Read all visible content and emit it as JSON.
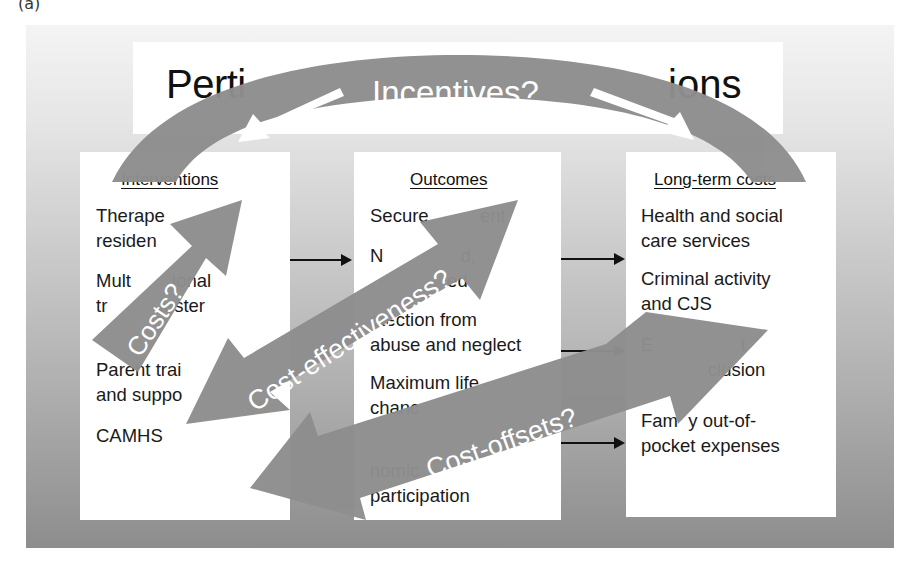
{
  "panel_label": "(a)",
  "title": {
    "left_part": "Perti",
    "right_part": "ions",
    "full_text_partially_hidden": "Pertinent questions"
  },
  "boxes": [
    {
      "heading": "Interventions",
      "items": [
        {
          "line1": "Therape",
          "line2": "residen"
        },
        {
          "line1": "Mult        ional",
          "line2": "tr          foster"
        },
        {
          "line1": "Parent trai",
          "line2": "and suppo"
        },
        {
          "line1": "CAMHS",
          "line2": ""
        }
      ]
    },
    {
      "heading": "Outcomes",
      "items": [
        {
          "line1": "Secure          ent",
          "line2": ""
        },
        {
          "line1": "N               d,",
          "line2": "               ed"
        },
        {
          "line1": "otection from",
          "line2": "abuse and neglect"
        },
        {
          "line1": "Maximum life",
          "line2": "chanc"
        },
        {
          "line1": "nomic",
          "line2": "participation"
        }
      ]
    },
    {
      "heading": "Long-term costs",
      "items": [
        {
          "line1": "Health and social",
          "line2": "care services"
        },
        {
          "line1": "Criminal activity",
          "line2": "and CJS"
        },
        {
          "line1": "E                 t",
          "line2": "             clusion"
        },
        {
          "line1": "Fam  y out-of-",
          "line2": "pocket expenses"
        }
      ]
    }
  ],
  "overlay_arrows": [
    {
      "label": "Incentives?",
      "shape": "arc",
      "direction": "bidirectional"
    },
    {
      "label": "Costs?",
      "shape": "straight",
      "direction": "up-right"
    },
    {
      "label": "Cost-effectiveness?",
      "shape": "straight",
      "direction": "bidirectional-diagonal"
    },
    {
      "label": "Cost-offsets?",
      "shape": "straight",
      "direction": "bidirectional-diagonal"
    }
  ],
  "colors": {
    "arrow_fill": "#8e8e8e",
    "box_fill": "#ffffff",
    "text": "#1a1a1a",
    "arrow_label": "#ffffff"
  }
}
